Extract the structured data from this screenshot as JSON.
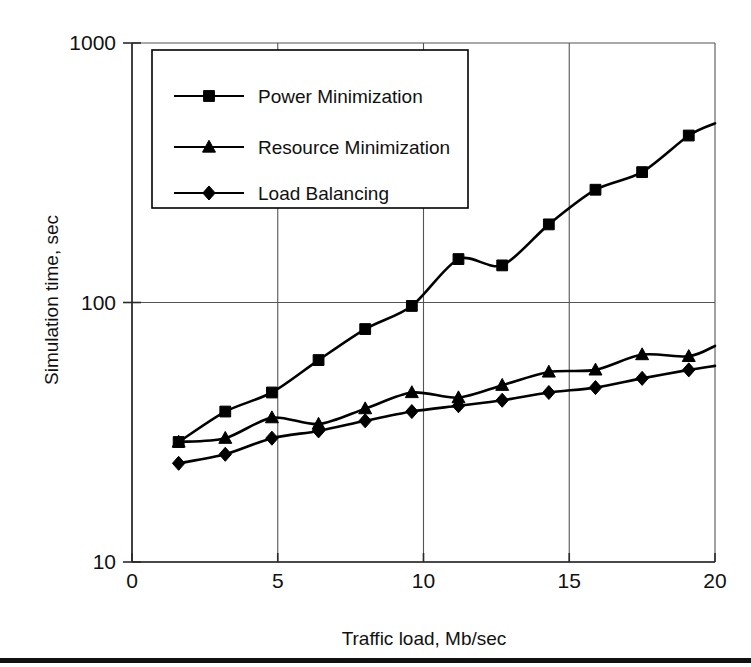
{
  "figure": {
    "background": "#ffffff",
    "ink": "#000000",
    "grid_color": "#555555",
    "bottom_rule": true
  },
  "chart_data": {
    "type": "line",
    "title": "",
    "subtitle": "",
    "xlabel": "Traffic load, Mb/sec",
    "ylabel": "Simulation time, sec",
    "xscale": "linear",
    "yscale": "log",
    "xlim": [
      0,
      20
    ],
    "ylim": [
      10,
      1000
    ],
    "xticks": [
      0,
      5,
      10,
      15,
      20
    ],
    "xtick_labels": [
      "0",
      "5",
      "10",
      "15",
      "20"
    ],
    "yticks": [
      10,
      100,
      1000
    ],
    "ytick_labels": [
      "10",
      "100",
      "1000"
    ],
    "grid": true,
    "grid_axes": "both",
    "legend_position": "upper-left-inside",
    "series": [
      {
        "name": "Power Minimization",
        "marker": "square",
        "color": "#000000",
        "x": [
          1.6,
          3.2,
          4.8,
          6.4,
          8.0,
          9.6,
          11.2,
          12.7,
          14.3,
          15.9,
          17.5,
          19.1,
          20.0
        ],
        "y": [
          29,
          38,
          45,
          60,
          79,
          97,
          147,
          139,
          200,
          272,
          318,
          440,
          490
        ]
      },
      {
        "name": "Resource Minimization",
        "marker": "triangle",
        "color": "#000000",
        "x": [
          1.6,
          3.2,
          4.8,
          6.4,
          8.0,
          9.6,
          11.2,
          12.7,
          14.3,
          15.9,
          17.5,
          19.1,
          20.0
        ],
        "y": [
          29,
          30,
          36,
          34,
          39,
          45,
          43,
          48,
          54,
          55,
          63,
          62,
          68
        ]
      },
      {
        "name": "Load Balancing",
        "marker": "diamond",
        "color": "#000000",
        "x": [
          1.6,
          3.2,
          4.8,
          6.4,
          8.0,
          9.6,
          11.2,
          12.7,
          14.3,
          15.9,
          17.5,
          19.1,
          20.0
        ],
        "y": [
          24,
          26,
          30,
          32,
          35,
          38,
          40,
          42,
          45,
          47,
          51,
          55,
          57
        ]
      }
    ]
  },
  "legend": {
    "entries": [
      {
        "label": "Power Minimization",
        "marker": "square"
      },
      {
        "label": "Resource Minimization",
        "marker": "triangle"
      },
      {
        "label": "Load Balancing",
        "marker": "diamond"
      }
    ]
  }
}
